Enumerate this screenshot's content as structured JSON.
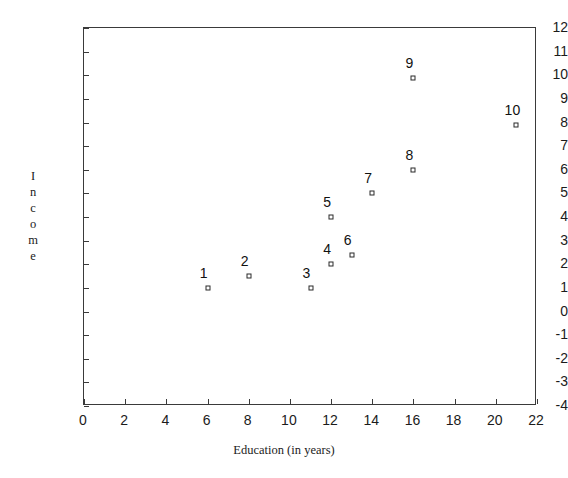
{
  "chart_data": {
    "type": "scatter",
    "title": "",
    "xlabel": "Education (in years)",
    "ylabel": "Income",
    "ylabel_letters": [
      "I",
      "n",
      "c",
      "o",
      "m",
      "e"
    ],
    "xlim": [
      0,
      22
    ],
    "ylim": [
      -4,
      12
    ],
    "xticks": [
      0,
      2,
      4,
      6,
      8,
      10,
      12,
      14,
      16,
      18,
      20,
      22
    ],
    "yticks": [
      -4,
      -3,
      -2,
      -1,
      0,
      1,
      2,
      3,
      4,
      5,
      6,
      7,
      8,
      9,
      10,
      11,
      12
    ],
    "xtick_labels": [
      "0",
      "2",
      "4",
      "6",
      "8",
      "10",
      "12",
      "14",
      "16",
      "18",
      "20",
      "22"
    ],
    "ytick_labels": [
      "-4",
      "-3",
      "-2",
      "-1",
      "0",
      "1",
      "2",
      "3",
      "4",
      "5",
      "6",
      "7",
      "8",
      "9",
      "10",
      "11",
      "12"
    ],
    "grid": false,
    "legend": false,
    "marker_style": "open-square",
    "marker_color": "#2a2a2a",
    "axis_color": "#3a3a3a",
    "points": [
      {
        "label": "1",
        "x": 6,
        "y": 1.0
      },
      {
        "label": "2",
        "x": 8,
        "y": 1.5
      },
      {
        "label": "3",
        "x": 11,
        "y": 1.0
      },
      {
        "label": "4",
        "x": 12,
        "y": 2.0
      },
      {
        "label": "5",
        "x": 12,
        "y": 4.0
      },
      {
        "label": "6",
        "x": 13,
        "y": 2.4
      },
      {
        "label": "7",
        "x": 14,
        "y": 5.0
      },
      {
        "label": "8",
        "x": 16,
        "y": 6.0
      },
      {
        "label": "9",
        "x": 16,
        "y": 9.9
      },
      {
        "label": "10",
        "x": 21,
        "y": 7.9
      }
    ]
  }
}
